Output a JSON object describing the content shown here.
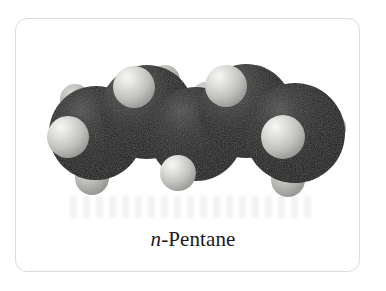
{
  "figure": {
    "kind": "space-filling-molecular-model",
    "caption_prefix": "n",
    "caption_rest": "-Pentane",
    "caption_full": "n-Pentane",
    "molecule_name": "n-Pentane",
    "formula": "C5H12"
  },
  "frame": {
    "border_color": "#dcdcdc",
    "background_color": "#ffffff",
    "corner_radius_px": 12
  },
  "palette": {
    "carbon_dark": "#101010",
    "carbon_mid": "#2e2e2e",
    "carbon_highlight": "#575757",
    "hydrogen_light": "#e8e8e6",
    "hydrogen_mid": "#b9b9b5",
    "hydrogen_shadow": "#8e8e8a",
    "page_background": "#ffffff",
    "caption_color": "#1a1a1a"
  },
  "model": {
    "carbon_count": 5,
    "hydrogen_count": 12,
    "carbon_atoms": [
      {
        "label": "C1",
        "cx": 96,
        "cy": 133,
        "r": 47
      },
      {
        "label": "C2",
        "cx": 147,
        "cy": 112,
        "r": 47
      },
      {
        "label": "C3",
        "cx": 196,
        "cy": 134,
        "r": 47
      },
      {
        "label": "C4",
        "cx": 246,
        "cy": 111,
        "r": 47
      },
      {
        "label": "C5",
        "cx": 295,
        "cy": 133,
        "r": 50
      }
    ],
    "hydrogen_atoms": [
      {
        "label": "H-C1-front",
        "cx": 68,
        "cy": 137,
        "r": 21
      },
      {
        "label": "H-C1-upper",
        "cx": 75,
        "cy": 99,
        "r": 15
      },
      {
        "label": "H-C1-lower",
        "cx": 92,
        "cy": 178,
        "r": 17
      },
      {
        "label": "H-C2-top",
        "cx": 134,
        "cy": 87,
        "r": 21
      },
      {
        "label": "H-C2-back",
        "cx": 165,
        "cy": 80,
        "r": 15
      },
      {
        "label": "H-C3-bottom",
        "cx": 178,
        "cy": 173,
        "r": 18
      },
      {
        "label": "H-C3-back",
        "cx": 206,
        "cy": 96,
        "r": 14
      },
      {
        "label": "H-C4-top",
        "cx": 226,
        "cy": 86,
        "r": 21
      },
      {
        "label": "H-C4-back",
        "cx": 256,
        "cy": 80,
        "r": 15
      },
      {
        "label": "H-C5-front",
        "cx": 283,
        "cy": 137,
        "r": 22
      },
      {
        "label": "H-C5-lower",
        "cx": 288,
        "cy": 180,
        "r": 17
      },
      {
        "label": "H-C5-right",
        "cx": 330,
        "cy": 128,
        "r": 16
      }
    ]
  }
}
